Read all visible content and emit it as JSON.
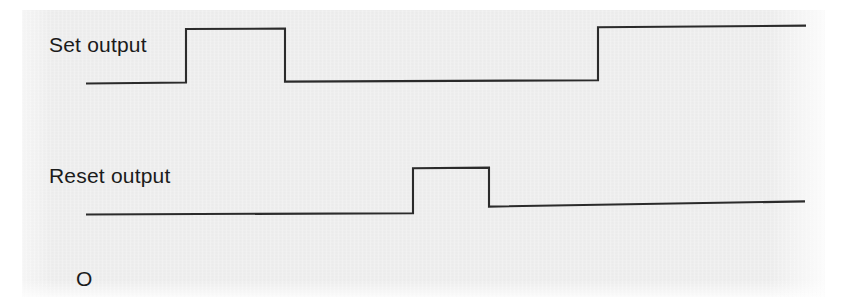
{
  "figure": {
    "background_color": "#ffffff",
    "panel_color": "#ebebeb",
    "trace_color": "#2b2b2b",
    "corner_mark": "O"
  },
  "labels": {
    "set_output": "Set output",
    "reset_output": "Reset output"
  },
  "chart_data": {
    "type": "line",
    "title": "",
    "subtitle": "",
    "xlabel": "",
    "ylabel": "",
    "grid": false,
    "legend_position": "left-inline",
    "xlim": [
      86,
      806
    ],
    "ylim": [
      0,
      1
    ],
    "series": [
      {
        "name": "Set output",
        "label": "Set output",
        "label_x": 49,
        "label_baseline_y": 52,
        "low_level_y": 83,
        "high_level_y": 29,
        "low_level_y_end": 80,
        "high_level_y_end": 27,
        "start_x": 86,
        "end_x": 806,
        "transitions": [
          {
            "x": 186,
            "edge": "rising",
            "to": 1
          },
          {
            "x": 285,
            "edge": "falling",
            "to": 0
          },
          {
            "x": 598,
            "edge": "rising",
            "to": 1
          }
        ],
        "levels": [
          {
            "from_x": 86,
            "to_x": 186,
            "value": 0
          },
          {
            "from_x": 186,
            "to_x": 285,
            "value": 1
          },
          {
            "from_x": 285,
            "to_x": 598,
            "value": 0
          },
          {
            "from_x": 598,
            "to_x": 806,
            "value": 1
          }
        ],
        "path": "M 86,83.5 L 186,82.5 L 186,29 L 285,28.6 L 285,81.6 L 598,80.3 L 598,27.3 L 806,25.6"
      },
      {
        "name": "Reset output",
        "label": "Reset output",
        "label_x": 49,
        "label_baseline_y": 183,
        "low_level_y": 214,
        "high_level_y": 168,
        "low_level_y_end": 201,
        "start_x": 86,
        "end_x": 805,
        "transitions": [
          {
            "x": 413,
            "edge": "rising",
            "to": 1
          },
          {
            "x": 489,
            "edge": "falling",
            "to": 0
          }
        ],
        "levels": [
          {
            "from_x": 86,
            "to_x": 413,
            "value": 0
          },
          {
            "from_x": 413,
            "to_x": 489,
            "value": 1
          },
          {
            "from_x": 489,
            "to_x": 805,
            "value": 0
          }
        ],
        "path": "M 86,214.5 L 413,213.2 L 413,168.2 L 489,167.6 L 489,206.6 L 805,201.4"
      }
    ]
  }
}
